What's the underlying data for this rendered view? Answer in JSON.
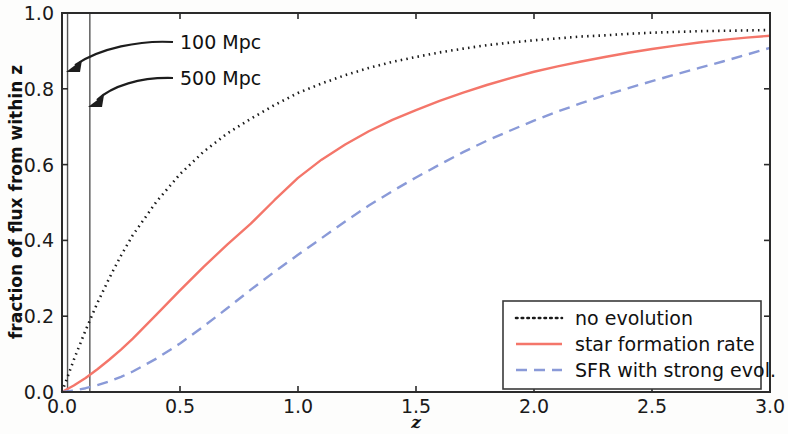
{
  "chart_data": {
    "type": "line",
    "title": "",
    "xlabel": "z",
    "ylabel": "fraction of flux from within z",
    "xlim": [
      0.0,
      3.0
    ],
    "ylim": [
      0.0,
      1.0
    ],
    "grid": false,
    "xticks": [
      "0.0",
      "0.5",
      "1.0",
      "1.5",
      "2.0",
      "2.5",
      "3.0"
    ],
    "xtick_values": [
      0.0,
      0.5,
      1.0,
      1.5,
      2.0,
      2.5,
      3.0
    ],
    "yticks": [
      "0.0",
      "0.2",
      "0.4",
      "0.6",
      "0.8",
      "1.0"
    ],
    "ytick_values": [
      0.0,
      0.2,
      0.4,
      0.6,
      0.8,
      1.0
    ],
    "legend_position": "lower right",
    "x": [
      0.0,
      0.05,
      0.1,
      0.15,
      0.2,
      0.25,
      0.3,
      0.4,
      0.5,
      0.6,
      0.7,
      0.8,
      0.9,
      1.0,
      1.1,
      1.2,
      1.3,
      1.4,
      1.5,
      1.6,
      1.7,
      1.8,
      1.9,
      2.0,
      2.1,
      2.2,
      2.3,
      2.4,
      2.5,
      2.6,
      2.7,
      2.8,
      2.9,
      3.0
    ],
    "series": [
      {
        "name": "no evolution",
        "style": "dotted",
        "color": "#1a1a1a",
        "values": [
          0.0,
          0.085,
          0.163,
          0.235,
          0.3,
          0.36,
          0.414,
          0.502,
          0.575,
          0.634,
          0.682,
          0.721,
          0.757,
          0.789,
          0.814,
          0.836,
          0.855,
          0.871,
          0.884,
          0.896,
          0.906,
          0.915,
          0.922,
          0.928,
          0.933,
          0.938,
          0.941,
          0.945,
          0.948,
          0.95,
          0.952,
          0.953,
          0.954,
          0.955
        ]
      },
      {
        "name": "star formation rate",
        "style": "solid",
        "color": "#f4766a",
        "values": [
          0.0,
          0.017,
          0.037,
          0.06,
          0.085,
          0.112,
          0.141,
          0.204,
          0.268,
          0.33,
          0.389,
          0.444,
          0.506,
          0.565,
          0.613,
          0.653,
          0.688,
          0.718,
          0.744,
          0.768,
          0.79,
          0.81,
          0.828,
          0.845,
          0.859,
          0.872,
          0.884,
          0.895,
          0.905,
          0.914,
          0.922,
          0.929,
          0.935,
          0.94
        ]
      },
      {
        "name": "SFR with strong evol.",
        "style": "dashed",
        "color": "#8a9ad8",
        "values": [
          0.0,
          0.004,
          0.01,
          0.018,
          0.028,
          0.04,
          0.054,
          0.088,
          0.128,
          0.173,
          0.221,
          0.27,
          0.317,
          0.362,
          0.406,
          0.45,
          0.492,
          0.53,
          0.566,
          0.6,
          0.633,
          0.663,
          0.69,
          0.716,
          0.74,
          0.762,
          0.783,
          0.802,
          0.82,
          0.838,
          0.855,
          0.872,
          0.89,
          0.908
        ]
      }
    ],
    "vertical_lines": [
      {
        "label": "100 Mpc",
        "z": 0.0235
      },
      {
        "label": "500 Mpc",
        "z": 0.118
      }
    ],
    "annotations": [
      {
        "text": "100 Mpc",
        "points_to": "100 Mpc line"
      },
      {
        "text": "500 Mpc",
        "points_to": "500 Mpc line"
      }
    ]
  }
}
